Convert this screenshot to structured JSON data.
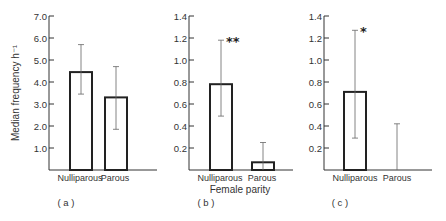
{
  "figure": {
    "xlabel_shared": "Female parity",
    "ylabel_shared": "Median frequency h⁻¹"
  },
  "chart_data": [
    {
      "type": "bar",
      "panel": "(a)",
      "title": "",
      "xlabel": "",
      "ylabel": "Median frequency h⁻¹",
      "categories": [
        "Nulliparous",
        "Parous"
      ],
      "values": [
        4.45,
        3.3
      ],
      "error_low": [
        3.45,
        1.85
      ],
      "error_high": [
        5.7,
        4.7
      ],
      "significance": [
        "",
        ""
      ],
      "yticks": [
        "1.0",
        "2.0",
        "3.0",
        "4.0",
        "5.0",
        "6.0",
        "7.0"
      ],
      "ylim": [
        0,
        7.0
      ],
      "grid": false
    },
    {
      "type": "bar",
      "panel": "(b)",
      "title": "",
      "xlabel": "Female parity",
      "ylabel": "",
      "categories": [
        "Nulliparous",
        "Parous"
      ],
      "values": [
        0.78,
        0.07
      ],
      "error_low": [
        0.49,
        0.0
      ],
      "error_high": [
        1.18,
        0.25
      ],
      "significance": [
        "**",
        ""
      ],
      "yticks": [
        "0.2",
        "0.4",
        "0.6",
        "0.8",
        "1.0",
        "1.2",
        "1.4"
      ],
      "ylim": [
        0,
        1.4
      ],
      "grid": false
    },
    {
      "type": "bar",
      "panel": "(c)",
      "title": "",
      "xlabel": "",
      "ylabel": "",
      "categories": [
        "Nulliparous",
        "Parous"
      ],
      "values": [
        0.71,
        0.0
      ],
      "error_low": [
        0.29,
        0.0
      ],
      "error_high": [
        1.27,
        0.42
      ],
      "significance": [
        "*",
        ""
      ],
      "yticks": [
        "0.2",
        "0.4",
        "0.6",
        "0.8",
        "1.0",
        "1.2",
        "1.4"
      ],
      "ylim": [
        0,
        1.4
      ],
      "grid": false
    }
  ]
}
